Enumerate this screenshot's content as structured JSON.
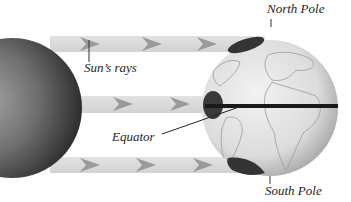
{
  "diagram": {
    "labels": {
      "north_pole": "North Pole",
      "suns_rays": "Sun’s rays",
      "equator": "Equator",
      "south_pole": "South Pole"
    },
    "elements": {
      "sun": "sun-sphere",
      "earth": "earth-globe",
      "rays": [
        "ray-top",
        "ray-middle",
        "ray-bottom"
      ],
      "ray_arrow_icon": "triangle-right"
    },
    "colors": {
      "ray_band": "#d9d9d9",
      "ray_arrow": "#9a9a9a",
      "sun_dark": "#3a3a3a",
      "sun_light": "#9a9a9a",
      "globe_light": "#e8e8e8",
      "globe_shade": "#b8b8b8",
      "highlight_patch": "#3a3a3a",
      "equator_line": "#1a1a1a",
      "text": "#1e1e1e"
    }
  }
}
